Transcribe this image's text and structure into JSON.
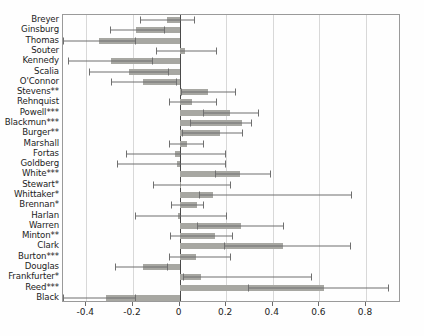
{
  "chart_data": {
    "type": "bar",
    "orientation": "horizontal",
    "title": "",
    "subtitle": "",
    "xlabel": "",
    "ylabel": "",
    "xlim": [
      -0.5,
      0.95
    ],
    "ylim": [
      0,
      30
    ],
    "grid": true,
    "grid_axis": "x",
    "legend": null,
    "legend_position": "none",
    "zero_reference_line": 0,
    "xticks": [
      -0.4,
      -0.2,
      0,
      0.2,
      0.4,
      0.6,
      0.8
    ],
    "xticklabels": [
      "-0.4",
      "-0.2",
      "0",
      "0.2",
      "0.4",
      "0.6",
      "0.8"
    ],
    "categories": [
      "Breyer",
      "Ginsburg",
      "Thomas",
      "Souter",
      "Kennedy",
      "Scalia",
      "O'Connor",
      "Stevens**",
      "Rehnquist",
      "Powell***",
      "Blackmun***",
      "Burger**",
      "Marshall",
      "Fortas",
      "Goldberg",
      "White***",
      "Stewart*",
      "Whittaker*",
      "Brennan*",
      "Harlan",
      "Warren",
      "Minton**",
      "Clark",
      "Burton***",
      "Douglas",
      "Frankfurter*",
      "Reed***",
      "Black"
    ],
    "values": [
      -0.055,
      -0.185,
      -0.345,
      0.025,
      -0.295,
      -0.215,
      -0.155,
      0.12,
      0.055,
      0.215,
      0.27,
      0.175,
      0.03,
      -0.02,
      -0.01,
      0.26,
      0.005,
      0.145,
      0.075,
      -0.005,
      0.265,
      0.15,
      0.445,
      0.07,
      -0.155,
      0.09,
      0.62,
      -0.315
    ],
    "ci_low": [
      -0.17,
      -0.3,
      -0.5,
      -0.1,
      -0.48,
      -0.39,
      -0.295,
      0.005,
      -0.045,
      0.1,
      0.045,
      0.01,
      -0.045,
      -0.23,
      -0.27,
      0.15,
      -0.115,
      0.085,
      -0.035,
      -0.19,
      0.075,
      -0.04,
      0.19,
      -0.045,
      -0.275,
      0.015,
      0.295,
      -0.5
    ],
    "ci_high": [
      0.06,
      -0.065,
      -0.19,
      0.155,
      -0.12,
      -0.05,
      -0.015,
      0.24,
      0.155,
      0.335,
      0.305,
      0.27,
      0.1,
      0.195,
      0.195,
      0.39,
      0.215,
      0.735,
      0.1,
      0.2,
      0.445,
      0.225,
      0.73,
      0.215,
      -0.055,
      0.565,
      0.895,
      -0.19
    ],
    "bar_color": "#a7a7a2",
    "error_bar_color": "#6f6f6f",
    "grid_color": "#d8d8d8",
    "axis_color": "#9a9a9a"
  }
}
